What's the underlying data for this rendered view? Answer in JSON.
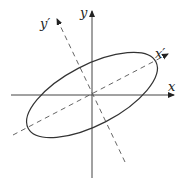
{
  "diagram": {
    "labels": {
      "x_axis": "x",
      "y_axis": "y",
      "x_prime_axis": "x′",
      "y_prime_axis": "y′"
    },
    "colors": {
      "stroke": "#333333",
      "dashed": "#555555",
      "background": "#ffffff"
    },
    "geometry": {
      "origin": [
        92,
        95
      ],
      "x_axis": {
        "from": [
          11,
          95
        ],
        "to": [
          174,
          95
        ]
      },
      "y_axis": {
        "from": [
          92,
          178
        ],
        "to": [
          92,
          11
        ]
      },
      "x_prime_axis": {
        "from": [
          13,
          135
        ],
        "to": [
          168,
          54
        ]
      },
      "y_prime_axis": {
        "from": [
          125,
          162
        ],
        "to": [
          57,
          19
        ]
      },
      "ellipse": {
        "cx": 92,
        "cy": 95,
        "rx": 72,
        "ry": 30,
        "rotation_deg": -27.5
      }
    }
  }
}
